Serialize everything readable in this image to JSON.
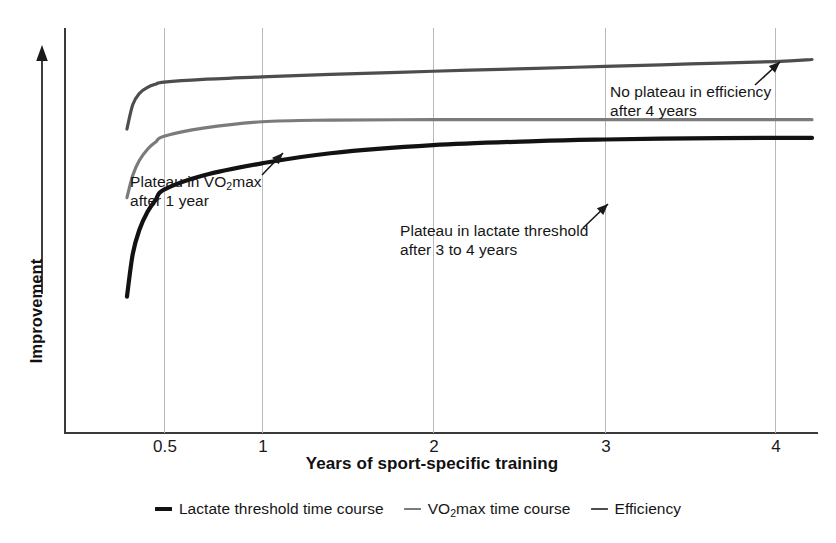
{
  "chart_data": {
    "type": "line",
    "title": "",
    "xlabel": "Years of sport-specific training",
    "ylabel": "Improvement",
    "grid": true,
    "legend_position": "bottom",
    "x_ticks": [
      {
        "label": "0.5",
        "value": 0.5,
        "px": 164
      },
      {
        "label": "1",
        "value": 1,
        "px": 262
      },
      {
        "label": "2",
        "value": 2,
        "px": 433
      },
      {
        "label": "3",
        "value": 3,
        "px": 605
      },
      {
        "label": "4",
        "value": 4,
        "px": 775
      }
    ],
    "y_axis": {
      "label": "Improvement",
      "tick_labels": [],
      "arrow_direction": "up",
      "description": "Improvement increases upward, unitless"
    },
    "xlim": [
      0.05,
      4.3
    ],
    "ylim": [
      0,
      1
    ],
    "series": [
      {
        "name": "Lactate threshold time course",
        "color": "#121212",
        "x": [
          0.05,
          0.12,
          0.2,
          0.3,
          0.4,
          0.5,
          0.7,
          1.0,
          1.4,
          2.0,
          2.6,
          3.0,
          3.5,
          4.0,
          4.3
        ],
        "values": [
          0.335,
          0.44,
          0.5,
          0.545,
          0.575,
          0.6,
          0.635,
          0.665,
          0.69,
          0.71,
          0.72,
          0.724,
          0.727,
          0.728,
          0.728
        ],
        "plateau_year": "3 to 4",
        "plateau_note": "Plateau in lactate threshold after 3 to 4 years"
      },
      {
        "name": "VO2max time course",
        "color": "#7b7b7b",
        "x": [
          0.05,
          0.12,
          0.2,
          0.3,
          0.4,
          0.5,
          0.7,
          1.0,
          1.4,
          2.0,
          2.6,
          3.0,
          3.5,
          4.0,
          4.3
        ],
        "values": [
          0.58,
          0.635,
          0.672,
          0.7,
          0.718,
          0.732,
          0.752,
          0.768,
          0.772,
          0.773,
          0.773,
          0.773,
          0.773,
          0.773,
          0.773
        ],
        "plateau_year": "1",
        "plateau_note": "Plateau in VO2max after 1 year"
      },
      {
        "name": "Efficiency",
        "color": "#4d4d4d",
        "x": [
          0.05,
          0.12,
          0.2,
          0.3,
          0.4,
          0.5,
          0.7,
          1.0,
          1.4,
          2.0,
          2.6,
          3.0,
          3.5,
          4.0,
          4.3
        ],
        "values": [
          0.75,
          0.81,
          0.838,
          0.853,
          0.861,
          0.866,
          0.873,
          0.879,
          0.885,
          0.893,
          0.9,
          0.905,
          0.911,
          0.917,
          0.922
        ],
        "plateau_year": "none",
        "plateau_note": "No plateau in efficiency after 4 years"
      }
    ],
    "annotations": [
      {
        "id": "vo2max",
        "line1": "Plateau in VO",
        "sub": "2",
        "line1_tail": "max",
        "line2": "after 1 year",
        "arrow_from": [
          262,
          175
        ],
        "arrow_to": [
          283,
          153
        ]
      },
      {
        "id": "lactate",
        "line1": "Plateau in lactate threshold",
        "line2": "after 3 to 4 years",
        "arrow_from": [
          583,
          228
        ],
        "arrow_to": [
          608,
          204
        ]
      },
      {
        "id": "efficiency",
        "line1": "No plateau in efficiency",
        "line2": "after 4 years",
        "arrow_from": [
          755,
          85
        ],
        "arrow_to": [
          780,
          62
        ]
      }
    ]
  },
  "axes": {
    "x_title": "Years of sport-specific training",
    "y_title": "Improvement",
    "tick_labels": [
      "0.5",
      "1",
      "2",
      "3",
      "4"
    ]
  },
  "legend": {
    "items": [
      {
        "label": "Lactate threshold time course",
        "color": "#121212"
      },
      {
        "label_pre": "VO",
        "label_sub": "2",
        "label_post": "max time course",
        "color": "#7b7b7b"
      },
      {
        "label": "Efficiency",
        "color": "#4d4d4d"
      }
    ]
  },
  "annotations": {
    "vo2max": {
      "line1_pre": "Plateau in VO",
      "line1_sub": "2",
      "line1_post": "max",
      "line2": "after 1 year"
    },
    "lactate": {
      "line1": "Plateau in lactate threshold",
      "line2": "after 3 to 4 years"
    },
    "efficiency": {
      "line1": "No plateau in efficiency",
      "line2": "after 4 years"
    }
  },
  "colors": {
    "lactate": "#121212",
    "vo2max": "#7b7b7b",
    "efficiency": "#4d4d4d",
    "axis": "#3a3a3a",
    "gridline": "#b9b9b9",
    "background": "#ffffff"
  }
}
